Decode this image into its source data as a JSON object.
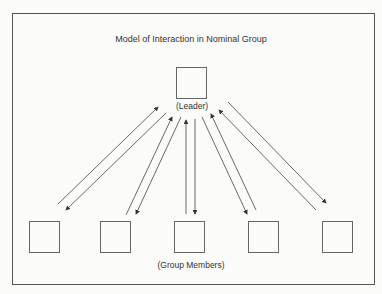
{
  "diagram": {
    "title": "Model of Interaction in Nominal Group",
    "leader": {
      "label": "(Leader)"
    },
    "members": {
      "label": "(Group Members)",
      "count": 5
    },
    "arrows": [
      {
        "from": "member-1",
        "to": "leader"
      },
      {
        "from": "leader",
        "to": "member-1"
      },
      {
        "from": "member-2",
        "to": "leader"
      },
      {
        "from": "leader",
        "to": "member-2"
      },
      {
        "from": "member-3",
        "to": "leader"
      },
      {
        "from": "leader",
        "to": "member-3"
      },
      {
        "from": "leader",
        "to": "member-4"
      },
      {
        "from": "member-4",
        "to": "leader"
      },
      {
        "from": "member-5",
        "to": "leader"
      },
      {
        "from": "leader",
        "to": "member-5"
      }
    ]
  }
}
